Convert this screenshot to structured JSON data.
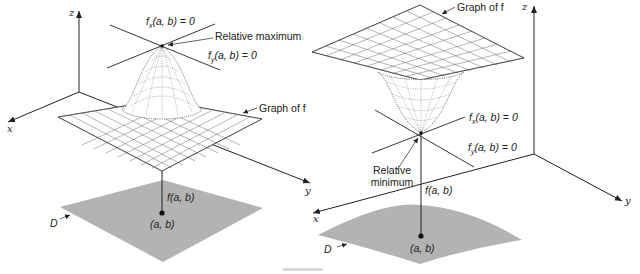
{
  "figure": {
    "caption_visible": "",
    "left_panel": {
      "title": "Relative maximum",
      "axes": {
        "x": "x",
        "y": "y",
        "z": "z"
      },
      "labels": {
        "fx": "fₓ(a, b) = 0",
        "fx_sub": "x",
        "fy_sub": "y",
        "fx_tail": "(a, b) = 0",
        "fy_tail": "(a, b) = 0",
        "extremum": "Relative maximum",
        "graph": "Graph of f",
        "value": "f(a, b)",
        "point": "(a, b)",
        "domain": "D"
      }
    },
    "right_panel": {
      "title": "Relative minimum",
      "axes": {
        "x": "x",
        "y": "y",
        "z": "z"
      },
      "labels": {
        "fx_sub": "x",
        "fy_sub": "y",
        "fx_tail": "(a, b) = 0",
        "fy_tail": "(a, b) = 0",
        "extremum_line1": "Relative",
        "extremum_line2": "minimum",
        "graph": "Graph of f",
        "value": "f(a, b)",
        "point": "(a, b)",
        "domain": "D"
      }
    },
    "colors": {
      "ink": "#222222",
      "domain_fill": "#b3b3b3",
      "mesh": "#333333",
      "background": "#ffffff"
    }
  }
}
